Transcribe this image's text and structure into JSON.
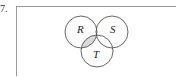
{
  "problem_number": "7.",
  "diagram": {
    "type": "venn",
    "sets": [
      {
        "name": "R",
        "label": "R"
      },
      {
        "name": "S",
        "label": "S"
      },
      {
        "name": "T",
        "label": "T"
      }
    ],
    "shaded_region": "R ∩ T",
    "colors": {
      "outline": "#555555",
      "shade": "#d9d9d9",
      "frame": "#999999"
    }
  }
}
